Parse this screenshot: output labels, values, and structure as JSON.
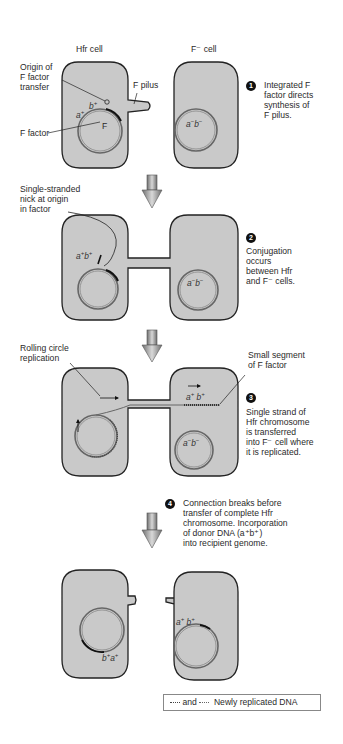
{
  "stage1": {
    "hfr_title": "Hfr cell",
    "fminus_title": "F⁻ cell",
    "label_origin": "Origin of\nF factor\ntransfer",
    "label_f_factor": "F factor",
    "label_f_pilus": "F pilus",
    "circle_label_f": "F",
    "step_number": "1",
    "step_text": "Integrated F\nfactor directs\nsynthesis of\nF pilus."
  },
  "stage2": {
    "label_nick": "Single-stranded\nnick at origin\nin factor",
    "step_number": "2",
    "step_text": "Conjugation\noccurs\nbetween Hfr\nand F⁻ cells."
  },
  "stage3": {
    "label_rolling": "Rolling circle\nreplication",
    "label_segment": "Small segment\nof F factor",
    "step_number": "3",
    "step_text": "Single strand of\nHfr chromosome\nis transferred\ninto F⁻ cell where\nit is replicated."
  },
  "stage4": {
    "step_number": "4",
    "step_text": "Connection breaks before\ntransfer of complete Hfr\nchromosome. Incorporation\nof donor DNA (a⁺b⁺)\ninto recipient genome."
  },
  "genes": {
    "a_plus": "a",
    "b_plus": "b",
    "plus": "+",
    "minus": "−"
  },
  "legend": {
    "and_text": "and",
    "label": "Newly replicated DNA"
  },
  "colors": {
    "cell_fill": "#c9c9c9",
    "cell_stroke": "#222222",
    "arrow_fill": "#8a8a8a"
  }
}
